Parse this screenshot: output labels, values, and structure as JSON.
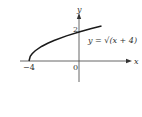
{
  "chart_data": {
    "type": "line",
    "title": "",
    "function_label": "y = √(x + 4)",
    "xlabel": "x",
    "ylabel": "y",
    "x_ticks": [
      {
        "value": -4,
        "label": "−4"
      }
    ],
    "y_ticks": [
      {
        "value": 2,
        "label": "2"
      }
    ],
    "origin_label": "0",
    "xlim": [
      -4.7,
      4.1
    ],
    "ylim": [
      -1.4,
      3.3
    ],
    "grid": false,
    "series": [
      {
        "name": "y = √(x + 4)",
        "x": [
          -4,
          -3.9,
          -3.75,
          -3.5,
          -3,
          -2.5,
          -2,
          -1,
          0,
          1,
          1.8
        ],
        "values": [
          0,
          0.316,
          0.5,
          0.707,
          1,
          1.225,
          1.414,
          1.732,
          2,
          2.236,
          2.408
        ]
      }
    ],
    "colors": {
      "curve": "#1a1a1a",
      "axes": "#555555",
      "text": "#333333"
    }
  }
}
